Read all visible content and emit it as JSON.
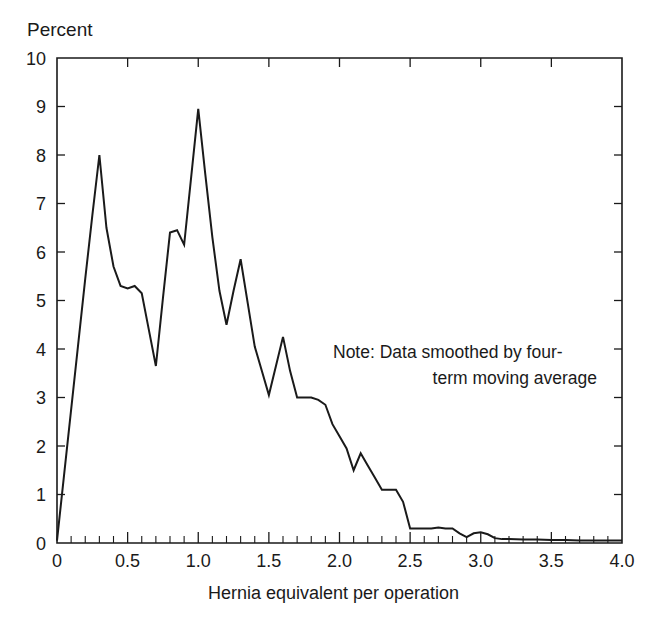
{
  "figure": {
    "ylabel": "Percent",
    "xlabel": "Hernia equivalent per operation",
    "note_line_1": "Note: Data smoothed by four-",
    "note_line_2": "term moving average",
    "line_color": "#1a1a1a",
    "background_color": "#ffffff"
  },
  "axes": {
    "y_ticks": [
      "10",
      "9",
      "8",
      "7",
      "6",
      "5",
      "4",
      "3",
      "2",
      "1",
      "0"
    ],
    "x_ticks": [
      "0",
      "0.5",
      "1.0",
      "1.5",
      "2.0",
      "2.5",
      "3.0",
      "3.5",
      "4.0"
    ]
  },
  "chart_data": {
    "type": "line",
    "title": "",
    "subtitle": "",
    "xlabel": "Hernia equivalent per operation",
    "ylabel": "Percent",
    "xlim": [
      0,
      4.0
    ],
    "ylim": [
      0,
      10
    ],
    "grid": false,
    "legend": "none",
    "annotations": [
      "Note: Data smoothed by four-term moving average"
    ],
    "x_tick_values": [
      0,
      0.5,
      1.0,
      1.5,
      2.0,
      2.5,
      3.0,
      3.5,
      4.0
    ],
    "x_minor_tick_step": 0.1,
    "y_tick_values": [
      0,
      1,
      2,
      3,
      4,
      5,
      6,
      7,
      8,
      9,
      10
    ],
    "x": [
      0.0,
      0.05,
      0.1,
      0.15,
      0.2,
      0.25,
      0.3,
      0.35,
      0.4,
      0.45,
      0.5,
      0.55,
      0.6,
      0.65,
      0.7,
      0.75,
      0.8,
      0.85,
      0.9,
      0.95,
      1.0,
      1.05,
      1.1,
      1.15,
      1.2,
      1.25,
      1.3,
      1.35,
      1.4,
      1.45,
      1.5,
      1.55,
      1.6,
      1.65,
      1.7,
      1.75,
      1.8,
      1.85,
      1.9,
      1.95,
      2.0,
      2.05,
      2.1,
      2.15,
      2.2,
      2.25,
      2.3,
      2.35,
      2.4,
      2.45,
      2.5,
      2.55,
      2.6,
      2.65,
      2.7,
      2.75,
      2.8,
      2.85,
      2.9,
      2.95,
      3.0,
      3.05,
      3.1,
      3.15,
      3.2,
      3.3,
      3.4,
      3.5,
      3.6,
      3.7,
      3.8,
      3.9,
      4.0
    ],
    "y": [
      0.05,
      1.4,
      2.75,
      4.1,
      5.45,
      6.75,
      8.0,
      6.5,
      5.7,
      5.3,
      5.25,
      5.3,
      5.15,
      4.4,
      3.65,
      5.05,
      6.4,
      6.45,
      6.15,
      7.55,
      8.95,
      7.6,
      6.3,
      5.2,
      4.5,
      5.2,
      5.85,
      4.95,
      4.05,
      3.55,
      3.05,
      3.65,
      4.25,
      3.55,
      3.0,
      3.0,
      3.0,
      2.95,
      2.85,
      2.45,
      2.2,
      1.95,
      1.5,
      1.85,
      1.6,
      1.35,
      1.1,
      1.1,
      1.1,
      0.85,
      0.3,
      0.3,
      0.3,
      0.3,
      0.32,
      0.3,
      0.3,
      0.2,
      0.12,
      0.2,
      0.22,
      0.18,
      0.1,
      0.08,
      0.08,
      0.07,
      0.07,
      0.06,
      0.06,
      0.05,
      0.05,
      0.05,
      0.05
    ],
    "series": [
      {
        "name": "Distribution of hernia equivalent per operation",
        "values": [
          0.05,
          1.4,
          2.75,
          4.1,
          5.45,
          6.75,
          8.0,
          6.5,
          5.7,
          5.3,
          5.25,
          5.3,
          5.15,
          4.4,
          3.65,
          5.05,
          6.4,
          6.45,
          6.15,
          7.55,
          8.95,
          7.6,
          6.3,
          5.2,
          4.5,
          5.2,
          5.85,
          4.95,
          4.05,
          3.55,
          3.05,
          3.65,
          4.25,
          3.55,
          3.0,
          3.0,
          3.0,
          2.95,
          2.85,
          2.45,
          2.2,
          1.95,
          1.5,
          1.85,
          1.6,
          1.35,
          1.1,
          1.1,
          1.1,
          0.85,
          0.3,
          0.3,
          0.3,
          0.3,
          0.32,
          0.3,
          0.3,
          0.2,
          0.12,
          0.2,
          0.22,
          0.18,
          0.1,
          0.08,
          0.08,
          0.07,
          0.07,
          0.06,
          0.06,
          0.05,
          0.05,
          0.05,
          0.05
        ]
      }
    ]
  }
}
